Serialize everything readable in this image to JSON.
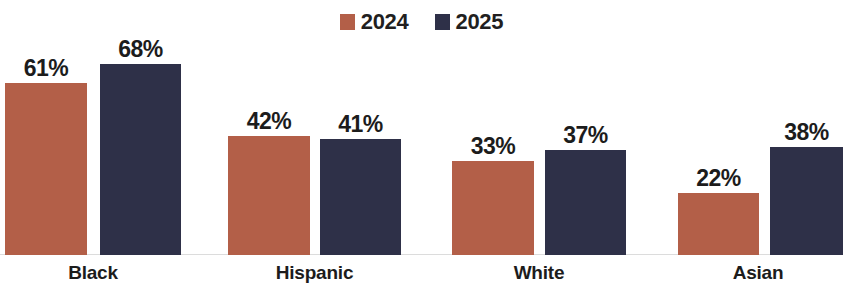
{
  "chart_data": {
    "type": "bar",
    "title": "",
    "subtitle": "",
    "xlabel": "",
    "ylabel": "",
    "ylim": [
      0,
      100
    ],
    "grid": false,
    "legend_position": "top-center",
    "categories": [
      "Black",
      "Hispanic",
      "White",
      "Asian"
    ],
    "series": [
      {
        "name": "2024",
        "color": "#B35F48",
        "values": [
          61,
          42,
          33,
          22
        ],
        "labels": [
          "61%",
          "42%",
          "33%",
          "22%"
        ]
      },
      {
        "name": "2025",
        "color": "#2E3048",
        "values": [
          68,
          41,
          37,
          38
        ],
        "labels": [
          "68%",
          "41%",
          "37%",
          "38%"
        ]
      }
    ],
    "value_label_suffix": "%",
    "note": "last 2025 bar is cropped at the right edge of the image"
  },
  "legend": {
    "items": [
      {
        "label": "2024",
        "color": "#B35F48",
        "swatch_name": "legend-swatch-2024"
      },
      {
        "label": "2025",
        "color": "#2E3048",
        "swatch_name": "legend-swatch-2025"
      }
    ]
  },
  "axis": {
    "categories": [
      {
        "label": "Black"
      },
      {
        "label": "Hispanic"
      },
      {
        "label": "White"
      },
      {
        "label": "Asian"
      }
    ]
  },
  "bars": [
    {
      "name": "bar-black-2024",
      "label": "61%",
      "series": "2024",
      "category": "Black",
      "value": 61,
      "color": "#B35F48",
      "left": 5,
      "width": 82,
      "height": 172
    },
    {
      "name": "bar-black-2025",
      "label": "68%",
      "series": "2025",
      "category": "Black",
      "value": 68,
      "color": "#2E3048",
      "left": 100,
      "width": 81,
      "height": 191
    },
    {
      "name": "bar-hispanic-2024",
      "label": "42%",
      "series": "2024",
      "category": "Hispanic",
      "value": 42,
      "color": "#B35F48",
      "left": 228,
      "width": 82,
      "height": 119
    },
    {
      "name": "bar-hispanic-2025",
      "label": "41%",
      "series": "2025",
      "category": "Hispanic",
      "value": 41,
      "color": "#2E3048",
      "left": 320,
      "width": 81,
      "height": 116
    },
    {
      "name": "bar-white-2024",
      "label": "33%",
      "series": "2024",
      "category": "White",
      "value": 33,
      "color": "#B35F48",
      "left": 452,
      "width": 82,
      "height": 94
    },
    {
      "name": "bar-white-2025",
      "label": "37%",
      "series": "2025",
      "category": "White",
      "value": 37,
      "color": "#2E3048",
      "left": 545,
      "width": 81,
      "height": 105
    },
    {
      "name": "bar-asian-2024",
      "label": "22%",
      "series": "2024",
      "category": "Asian",
      "value": 22,
      "color": "#B35F48",
      "left": 678,
      "width": 81,
      "height": 62
    },
    {
      "name": "bar-asian-2025",
      "label": "38%",
      "series": "2025",
      "category": "Asian",
      "value": 38,
      "color": "#2E3048",
      "left": 770,
      "width": 73,
      "height": 108
    }
  ],
  "category_positions": [
    {
      "name": "cat-label-black",
      "label": "Black",
      "left": 5,
      "width": 176
    },
    {
      "name": "cat-label-hispanic",
      "label": "Hispanic",
      "left": 228,
      "width": 173
    },
    {
      "name": "cat-label-white",
      "label": "White",
      "left": 452,
      "width": 174
    },
    {
      "name": "cat-label-asian",
      "label": "Asian",
      "left": 678,
      "width": 160
    }
  ]
}
